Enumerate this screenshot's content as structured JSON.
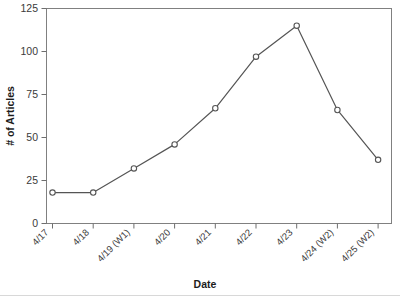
{
  "chart_data": {
    "type": "line",
    "title": "",
    "xlabel": "Date",
    "ylabel": "# of Articles",
    "categories": [
      "4/17",
      "4/18",
      "4/19 (W1)",
      "4/20",
      "4/21",
      "4/22",
      "4/23",
      "4/24 (W2)",
      "4/25 (W2)"
    ],
    "values": [
      18,
      18,
      32,
      46,
      67,
      97,
      115,
      66,
      37
    ],
    "series": [
      {
        "name": "# of Articles",
        "values": [
          18,
          18,
          32,
          46,
          67,
          97,
          115,
          66,
          37
        ]
      }
    ],
    "ylim": [
      0,
      125
    ],
    "yticks": [
      0,
      25,
      50,
      75,
      100,
      125
    ],
    "ytick_labels": [
      "0",
      "25",
      "50",
      "75",
      "100",
      "125"
    ],
    "grid": false,
    "legend": false,
    "legend_position": "none",
    "marker": "open-circle",
    "line_color": "#555555",
    "marker_fill": "#ffffff",
    "frame_color": "#808080",
    "xtick_rotation": -45
  },
  "axes": {
    "y_title": "# of Articles",
    "x_title": "Date"
  }
}
